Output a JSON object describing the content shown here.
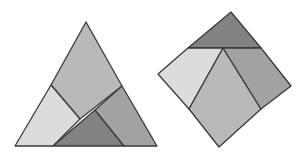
{
  "figure": {
    "colors": {
      "outline": "#3a3a3a",
      "light": "#dcdcdc",
      "medium_light": "#b9b9b9",
      "medium": "#a2a2a2",
      "dark": "#828282",
      "background": "#ffffff"
    },
    "triangle": {
      "pieces": [
        {
          "name": "top-quad",
          "fill": "#b9b9b9",
          "points": "51,85 86,22 122,86 80,119"
        },
        {
          "name": "left-quad",
          "fill": "#dcdcdc",
          "points": "15,146 51,85 80,119 53,146"
        },
        {
          "name": "bottom-triangle",
          "fill": "#828282",
          "points": "53,146 95,110 124,146"
        },
        {
          "name": "right-quad",
          "fill": "#a2a2a2",
          "points": "95,110 122,86 157,146 124,146"
        }
      ]
    },
    "square": {
      "pieces": [
        {
          "name": "top-triangle",
          "fill": "#828282",
          "points": "188,48 231,12 261,48"
        },
        {
          "name": "left-quad",
          "fill": "#dcdcdc",
          "points": "158,74 188,48 223,48 189,109"
        },
        {
          "name": "center-quad",
          "fill": "#b9b9b9",
          "points": "223,48 261,109 219,147 189,109"
        },
        {
          "name": "right-quad",
          "fill": "#a2a2a2",
          "points": "223,48 261,48 291,86 261,109"
        }
      ]
    }
  }
}
